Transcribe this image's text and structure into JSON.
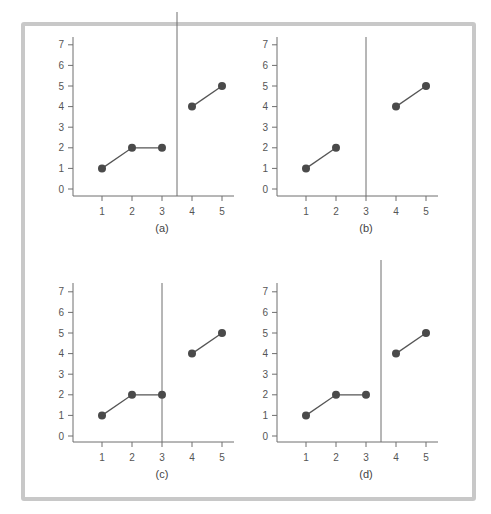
{
  "colors": {
    "frame": "#c8c8c8",
    "axis": "#6e6e6e",
    "line": "#555555",
    "point": "#4a4a4a",
    "text": "#555555"
  },
  "chart_data": [
    {
      "type": "line",
      "title": "(a)",
      "x_ticks": [
        "1",
        "2",
        "3",
        "4",
        "5"
      ],
      "y_ticks": [
        "0",
        "1",
        "2",
        "3",
        "4",
        "5",
        "6",
        "7"
      ],
      "ylim": [
        0,
        7
      ],
      "divider_x": 3.5,
      "segments": [
        {
          "x": [
            1,
            2,
            3
          ],
          "y": [
            1,
            2,
            2
          ]
        },
        {
          "x": [
            4,
            5
          ],
          "y": [
            4,
            5
          ]
        }
      ]
    },
    {
      "type": "line",
      "title": "(b)",
      "x_ticks": [
        "1",
        "2",
        "3",
        "4",
        "5"
      ],
      "y_ticks": [
        "0",
        "1",
        "2",
        "3",
        "4",
        "5",
        "6",
        "7"
      ],
      "ylim": [
        0,
        7
      ],
      "divider_x": 3,
      "segments": [
        {
          "x": [
            1,
            2
          ],
          "y": [
            1,
            2
          ]
        },
        {
          "x": [
            4,
            5
          ],
          "y": [
            4,
            5
          ]
        }
      ]
    },
    {
      "type": "line",
      "title": "(c)",
      "x_ticks": [
        "1",
        "2",
        "3",
        "4",
        "5"
      ],
      "y_ticks": [
        "0",
        "1",
        "2",
        "3",
        "4",
        "5",
        "6",
        "7"
      ],
      "ylim": [
        0,
        7
      ],
      "divider_x": 3,
      "segments": [
        {
          "x": [
            1,
            2,
            3
          ],
          "y": [
            1,
            2,
            2
          ]
        },
        {
          "x": [
            4,
            5
          ],
          "y": [
            4,
            5
          ]
        }
      ]
    },
    {
      "type": "line",
      "title": "(d)",
      "x_ticks": [
        "1",
        "2",
        "3",
        "4",
        "5"
      ],
      "y_ticks": [
        "0",
        "1",
        "2",
        "3",
        "4",
        "5",
        "6",
        "7"
      ],
      "ylim": [
        0,
        7
      ],
      "divider_x": 3.5,
      "divider_extends_above": true,
      "segments": [
        {
          "x": [
            1,
            2,
            3
          ],
          "y": [
            1,
            2,
            2
          ]
        },
        {
          "x": [
            4,
            5
          ],
          "y": [
            4,
            5
          ]
        }
      ]
    }
  ],
  "captions": [
    "(a)",
    "(b)",
    "(c)",
    "(d)"
  ]
}
